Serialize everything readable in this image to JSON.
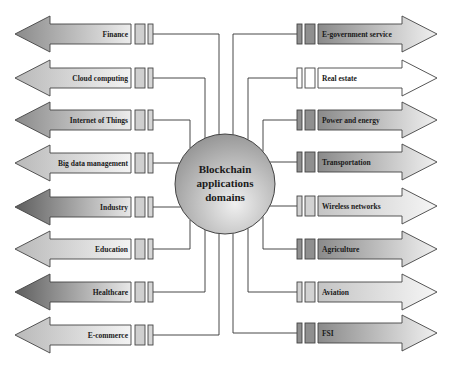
{
  "center": {
    "lines": [
      "Blockchain",
      "applications",
      "domains"
    ],
    "cx": 225,
    "cy": 184,
    "r": 50
  },
  "left_domains": [
    {
      "label": "Finance",
      "y": 34,
      "shade": "dark",
      "bus_x": 219
    },
    {
      "label": "Cloud computing",
      "y": 78,
      "shade": "light",
      "bus_x": 205
    },
    {
      "label": "Internet of Things",
      "y": 120,
      "shade": "dark",
      "bus_x": 190
    },
    {
      "label": "Big data management",
      "y": 163,
      "shade": "light",
      "bus_x": null
    },
    {
      "label": "Industry",
      "y": 207,
      "shade": "darkest",
      "bus_x": null
    },
    {
      "label": "Education",
      "y": 249,
      "shade": "light",
      "bus_x": 190
    },
    {
      "label": "Healthcare",
      "y": 292,
      "shade": "darkest",
      "bus_x": 205
    },
    {
      "label": "E-commerce",
      "y": 335,
      "shade": "light",
      "bus_x": 219
    }
  ],
  "right_domains": [
    {
      "label": "E-government service",
      "y": 34,
      "shade": "dark",
      "bus_x": 233
    },
    {
      "label": "Real estate",
      "y": 78,
      "shade": "white",
      "bus_x": 248
    },
    {
      "label": "Power and energy",
      "y": 120,
      "shade": "dark",
      "bus_x": 263
    },
    {
      "label": "Transportation",
      "y": 162,
      "shade": "dark",
      "bus_x": null
    },
    {
      "label": "Wireless networks",
      "y": 206,
      "shade": "light",
      "bus_x": null
    },
    {
      "label": "Agriculture",
      "y": 249,
      "shade": "dark",
      "bus_x": 263
    },
    {
      "label": "Aviation",
      "y": 292,
      "shade": "light",
      "bus_x": 248
    },
    {
      "label": "FSI",
      "y": 333,
      "shade": "dark",
      "bus_x": 233
    }
  ],
  "colors": {
    "darkest": [
      "#5e5e5e",
      "#e8e8e8"
    ],
    "dark": [
      "#8a8a8a",
      "#ececec"
    ],
    "light": [
      "#b9b9b9",
      "#f3f3f3"
    ],
    "white": [
      "#ffffff",
      "#ffffff"
    ],
    "stroke": "#444444",
    "circle_dark": "#8c8c8c",
    "circle_light": "#eeeeee"
  }
}
